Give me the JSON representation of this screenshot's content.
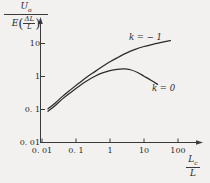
{
  "figure": {
    "background_color": "#f2f1ef",
    "axis_color": "#3a3a3a",
    "curve_color": "#2b2b2b"
  },
  "ylabel": {
    "numerator_symbol": "U",
    "numerator_subscript": "o",
    "denominator_symbol": "E",
    "denominator_paren_open": "(",
    "denominator_paren_close": ")",
    "denominator_frac_top": "ΔL",
    "denominator_frac_bottom": "L"
  },
  "xlabel": {
    "numerator_symbol": "L",
    "numerator_subscript": "c",
    "denominator_symbol": "L"
  },
  "yticks": [
    "10",
    "1",
    "0. 1",
    "0. 01"
  ],
  "xticks": [
    "0. 01",
    "0. 1",
    "1",
    "10",
    "100"
  ],
  "curve_labels": {
    "k_neg1": "k = − 1",
    "k_zero": "k = 0"
  },
  "chart_data": {
    "type": "line",
    "title": "",
    "xlabel": "Lc / L",
    "ylabel": "Uo / ( E (dL/L) )",
    "xscale": "log",
    "yscale": "log",
    "xlim": [
      0.01,
      100
    ],
    "ylim": [
      0.01,
      10
    ],
    "xticks": [
      0.01,
      0.1,
      1,
      10,
      100
    ],
    "xticklabels": [
      "0. 01",
      "0. 1",
      "1",
      "10",
      "100"
    ],
    "yticks": [
      0.01,
      0.1,
      1,
      10
    ],
    "yticklabels": [
      "0. 01",
      "0. 1",
      "1",
      "10"
    ],
    "grid": false,
    "legend": "annotations-on-curves",
    "series": [
      {
        "name": "k = − 1",
        "label_text": "k = − 1",
        "x": [
          0.015,
          0.025,
          0.04,
          0.07,
          0.12,
          0.2,
          0.35,
          0.6,
          1.0,
          1.8,
          3.0,
          5.5,
          10.0,
          20.0,
          35.0,
          60.0
        ],
        "y": [
          0.105,
          0.16,
          0.25,
          0.4,
          0.62,
          0.93,
          1.38,
          2.0,
          2.8,
          3.9,
          5.1,
          6.6,
          8.1,
          9.7,
          11.0,
          12.2
        ]
      },
      {
        "name": "k = 0",
        "label_text": "k = 0",
        "x": [
          0.015,
          0.025,
          0.04,
          0.07,
          0.12,
          0.2,
          0.35,
          0.6,
          1.0,
          1.6,
          2.6,
          4.0,
          6.5,
          10.0,
          16.0,
          25.0
        ],
        "y": [
          0.088,
          0.135,
          0.21,
          0.33,
          0.5,
          0.72,
          1.0,
          1.28,
          1.5,
          1.65,
          1.7,
          1.6,
          1.32,
          1.02,
          0.77,
          0.58
        ]
      }
    ]
  }
}
